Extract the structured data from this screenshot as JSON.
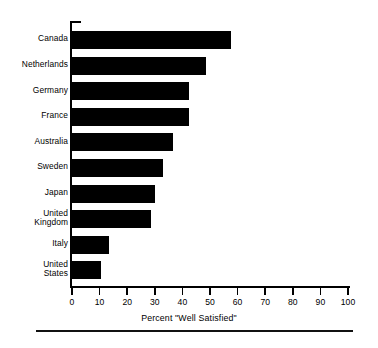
{
  "chart_data": {
    "type": "bar",
    "orientation": "horizontal",
    "title": "",
    "subtitle": "",
    "xlabel": "Percent \"Well Satisfied\"",
    "ylabel": "",
    "xlim": [
      0,
      100
    ],
    "xticks": [
      "0",
      "10",
      "20",
      "30",
      "40",
      "50",
      "60",
      "70",
      "80",
      "90",
      "100"
    ],
    "grid": false,
    "legend": null,
    "bar_color": "#000000",
    "background": "#FFFFFF",
    "categories": [
      "Canada",
      "Netherlands",
      "Germany",
      "France",
      "Australia",
      "Sweden",
      "Japan",
      "United\nKingdom",
      "Italy",
      "United\nStates"
    ],
    "values": [
      57.5,
      48.5,
      42.5,
      42.5,
      36.5,
      33,
      30,
      28.5,
      13.5,
      10.5
    ]
  },
  "footer": {
    "rule": ""
  }
}
